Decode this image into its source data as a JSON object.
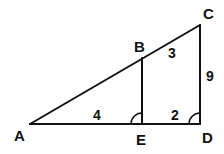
{
  "diagram": {
    "type": "similar-triangles",
    "points": {
      "A": {
        "label": "A",
        "x": 30,
        "y": 124
      },
      "B": {
        "label": "B",
        "x": 142,
        "y": 58
      },
      "C": {
        "label": "C",
        "x": 200,
        "y": 25
      },
      "D": {
        "label": "D",
        "x": 200,
        "y": 124
      },
      "E": {
        "label": "E",
        "x": 142,
        "y": 124
      }
    },
    "segments": [
      {
        "name": "AC",
        "from": "A",
        "to": "C"
      },
      {
        "name": "AD",
        "from": "A",
        "to": "D"
      },
      {
        "name": "BE",
        "from": "B",
        "to": "E"
      },
      {
        "name": "CD",
        "from": "C",
        "to": "D"
      }
    ],
    "lengths": {
      "AE": "4",
      "ED": "2",
      "BC": "3",
      "CD": "9"
    },
    "right_angles": [
      "E",
      "D"
    ],
    "stroke_color": "#111111"
  }
}
